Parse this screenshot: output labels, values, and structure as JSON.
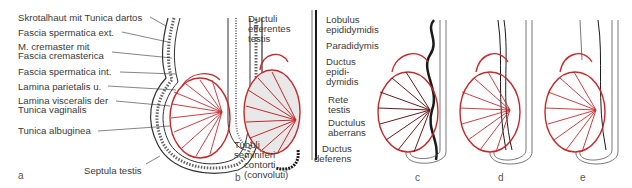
{
  "figure": {
    "colors": {
      "red": "#c8282a",
      "black": "#1a1a1a",
      "gray": "#888888",
      "background": "#ffffff"
    },
    "panel_letters": [
      "a",
      "b",
      "c",
      "d",
      "e"
    ],
    "panel_a": {
      "labels": [
        "Skrotalhaut mit Tunica dartos",
        "Fascia spermatica ext.",
        "M. cremaster mit",
        "Fascia cremasterica",
        "Fascia spermatica int.",
        "Lamina parietalis u.",
        "Lamina visceralis der",
        "Tunica vaginalis",
        "Tunica albuginea",
        "Septula testis"
      ]
    },
    "panel_b": {
      "labels_left": [
        "Ductuli",
        "efferentes",
        "testis",
        "Tubuli",
        "seminiferi",
        "contorti",
        "(convoluti)"
      ],
      "labels_right": [
        "Lobulus",
        "epididymidis",
        "Paradidymis",
        "Ductus",
        "epidi-",
        "dymidis",
        "Rete",
        "testis",
        "Ductulus",
        "aberrans",
        "Ductus",
        "deferens"
      ]
    }
  }
}
